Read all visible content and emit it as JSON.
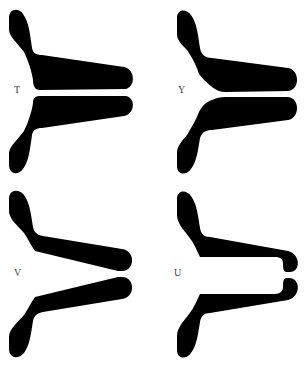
{
  "figure": {
    "panels": [
      {
        "id": "T",
        "label": "T",
        "shape": "T-shaped gap (parallel channel)"
      },
      {
        "id": "Y",
        "label": "Y",
        "shape": "Y-shaped gap (tapered entry, parallel channel)"
      },
      {
        "id": "V",
        "label": "V",
        "shape": "V-shaped gap (converging)"
      },
      {
        "id": "U",
        "label": "U",
        "shape": "U-shaped gap (wide cavity, narrow exit)"
      }
    ],
    "colors": {
      "fill": "#000000",
      "background": "#ffffff",
      "label": "#444444"
    }
  }
}
